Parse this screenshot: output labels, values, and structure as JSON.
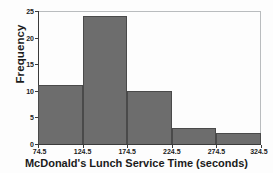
{
  "chart_data": {
    "type": "bar",
    "title": "",
    "xlabel": "McDonald's Lunch Service Time (seconds)",
    "ylabel": "Frequency",
    "bin_edges": [
      74.5,
      124.5,
      174.5,
      224.5,
      274.5,
      324.5
    ],
    "categories": [
      "74.5-124.5",
      "124.5-174.5",
      "174.5-224.5",
      "224.5-274.5",
      "274.5-324.5"
    ],
    "values": [
      11,
      24,
      10,
      3,
      2
    ],
    "xlim": [
      74.5,
      324.5
    ],
    "ylim": [
      0,
      25
    ],
    "xticks": [
      74.5,
      124.5,
      174.5,
      224.5,
      274.5,
      324.5
    ],
    "xtick_labels": [
      "74.5",
      "124.5",
      "174.5",
      "224.5",
      "274.5",
      "324.5"
    ],
    "yticks": [
      0,
      5,
      10,
      15,
      20,
      25
    ],
    "ytick_labels": [
      "0",
      "5",
      "10",
      "15",
      "20",
      "25"
    ],
    "grid": false,
    "legend": null,
    "bar_color": "#6d6d6d",
    "bar_edge_color": "#4a4a4a",
    "axis_color": "#3b3b3b",
    "frame_color": "#b9bcbe",
    "background_color": "#fdfdfd"
  }
}
